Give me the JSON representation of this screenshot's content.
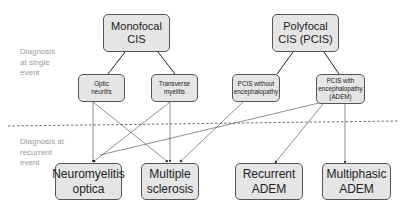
{
  "side_labels": {
    "single": "Diagnosis at single event",
    "recurrent": "Diagnosis at recurrent event"
  },
  "nodes": {
    "monofocal": "Monofocal CIS",
    "polyfocal": "Polyfocal CIS (PCIS)",
    "optic": "Optic neuritis",
    "transverse": "Transverse myelitis",
    "pcis_without": "PCIS without encephalopathy",
    "pcis_with": "PCIS with encephalopathy (ADEM)",
    "nmo": "Neuromyelitis optica",
    "ms": "Multiple sclerosis",
    "recurrent_adem": "Recurrent ADEM",
    "multiphasic_adem": "Multiphasic ADEM"
  },
  "edges": [
    [
      "monofocal",
      "optic"
    ],
    [
      "monofocal",
      "transverse"
    ],
    [
      "polyfocal",
      "pcis_without"
    ],
    [
      "polyfocal",
      "pcis_with"
    ],
    [
      "optic",
      "nmo"
    ],
    [
      "optic",
      "ms"
    ],
    [
      "transverse",
      "nmo"
    ],
    [
      "transverse",
      "ms"
    ],
    [
      "pcis_without",
      "ms"
    ],
    [
      "pcis_with",
      "ms"
    ],
    [
      "pcis_with",
      "recurrent_adem"
    ],
    [
      "pcis_with",
      "multiphasic_adem"
    ]
  ],
  "colors": {
    "box_fill": "#e5e5e5",
    "box_border": "#555555",
    "label": "#9a9a9a"
  }
}
